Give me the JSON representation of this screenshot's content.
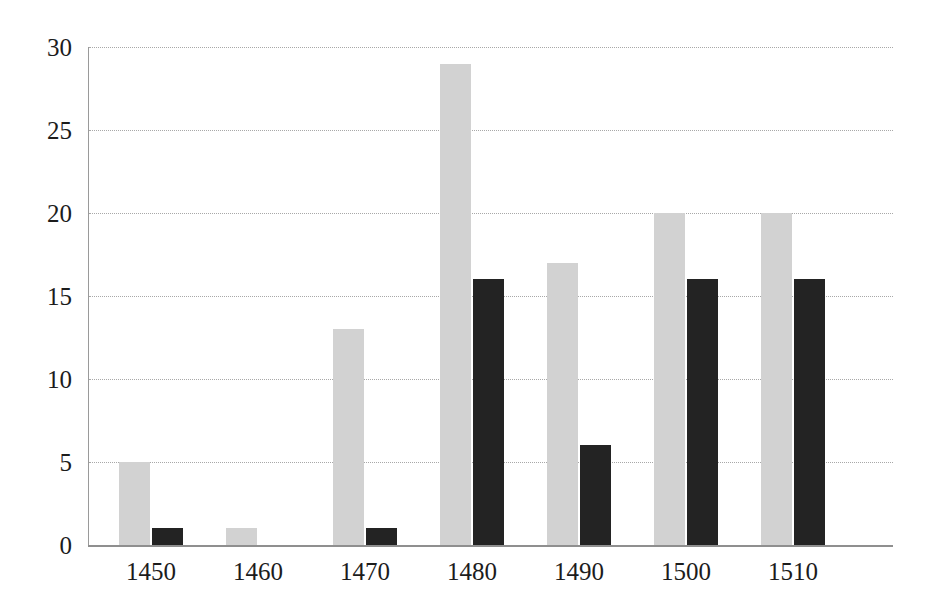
{
  "chart_data": {
    "type": "bar",
    "title": "",
    "subtitle": "",
    "xlabel": "",
    "ylabel": "",
    "categories": [
      "1450",
      "1460",
      "1470",
      "1480",
      "1490",
      "1500",
      "1510"
    ],
    "series": [
      {
        "name": "series-1",
        "color": "#d2d2d2",
        "values": [
          5,
          1,
          13,
          29,
          17,
          20,
          20
        ]
      },
      {
        "name": "series-2",
        "color": "#232323",
        "values": [
          1,
          0,
          1,
          16,
          6,
          16,
          16
        ]
      }
    ],
    "ylim": [
      0,
      30
    ],
    "yticks": [
      0,
      5,
      10,
      15,
      20,
      25,
      30
    ],
    "ytick_labels": [
      "0",
      "5",
      "10",
      "15",
      "20",
      "25",
      "30"
    ],
    "xtick_labels": [
      "1450",
      "1460",
      "1470",
      "1480",
      "1490",
      "1500",
      "1510"
    ],
    "grid": "horizontal-dotted",
    "legend": "none",
    "background": "#ffffff",
    "axis_color": "#8f8f8f",
    "grid_color": "#a8a8a8",
    "bar_width_px": 31,
    "group_spacing_px": 107
  }
}
